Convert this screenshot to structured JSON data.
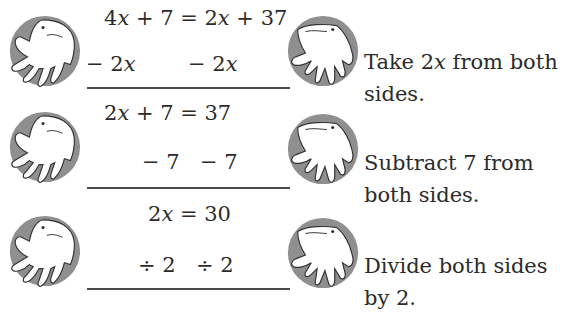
{
  "steps": [
    {
      "equation": [
        "4",
        "x",
        " + 7 = 2",
        "x",
        " + 37"
      ],
      "operation": {
        "left": [
          "− 2",
          "x"
        ],
        "right": [
          "− 2",
          "x"
        ]
      },
      "instruction": {
        "line1": [
          "Take 2",
          "x",
          " from both"
        ],
        "line2": "sides."
      }
    },
    {
      "equation": [
        "2",
        "x",
        " + 7 = 37"
      ],
      "operation": {
        "left": "− 7",
        "right": "− 7"
      },
      "instruction": {
        "line1": "Subtract 7 from",
        "line2": "both sides."
      }
    },
    {
      "equation": [
        "2",
        "x",
        " = 30"
      ],
      "operation": {
        "left": "÷ 2",
        "right": "÷ 2"
      },
      "instruction": {
        "line1": "Divide both sides",
        "line2": "by 2."
      }
    }
  ],
  "icons": {
    "left": "hand-icon",
    "right": "hand-icon"
  },
  "colors": {
    "text": "#2b2b2b",
    "circle": "#8c8c8c",
    "hand": "#ffffff",
    "rule": "#4a4a4a"
  }
}
